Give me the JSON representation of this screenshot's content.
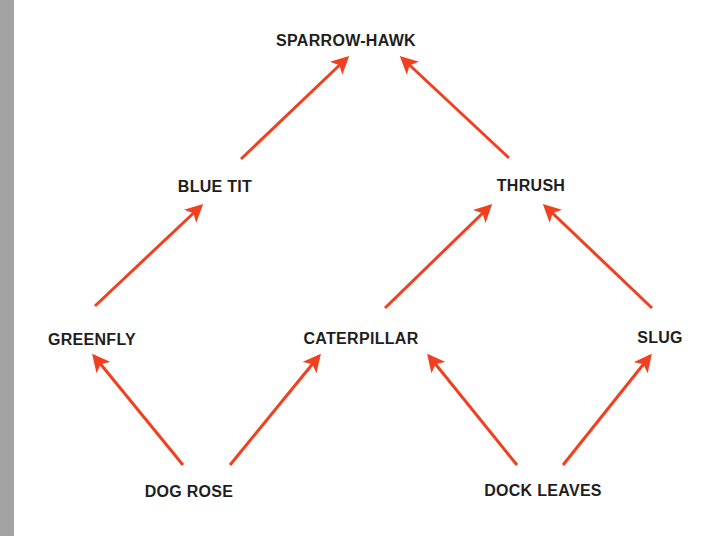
{
  "diagram": {
    "type": "food-web",
    "arrow_color": "#f04020",
    "text_color": "#1e1e1e",
    "strip_color": "#a3a3a3",
    "nodes": [
      {
        "id": "sparrowhawk",
        "label": "SPARROW-HAWK",
        "x": 346,
        "y": 41
      },
      {
        "id": "bluetit",
        "label": "BLUE TIT",
        "x": 215,
        "y": 187
      },
      {
        "id": "thrush",
        "label": "THRUSH",
        "x": 531,
        "y": 186
      },
      {
        "id": "greenfly",
        "label": "GREENFLY",
        "x": 92,
        "y": 340
      },
      {
        "id": "caterpillar",
        "label": "CATERPILLAR",
        "x": 361,
        "y": 339
      },
      {
        "id": "slug",
        "label": "SLUG",
        "x": 660,
        "y": 338
      },
      {
        "id": "dogrose",
        "label": "DOG ROSE",
        "x": 189,
        "y": 492
      },
      {
        "id": "dockleaves",
        "label": "DOCK LEAVES",
        "x": 543,
        "y": 491
      }
    ],
    "edges": [
      {
        "from": "bluetit",
        "to": "sparrowhawk",
        "x1": 241,
        "y1": 159,
        "x2": 347,
        "y2": 58
      },
      {
        "from": "thrush",
        "to": "sparrowhawk",
        "x1": 509,
        "y1": 158,
        "x2": 402,
        "y2": 58
      },
      {
        "from": "greenfly",
        "to": "bluetit",
        "x1": 95,
        "y1": 306,
        "x2": 201,
        "y2": 206
      },
      {
        "from": "caterpillar",
        "to": "thrush",
        "x1": 385,
        "y1": 308,
        "x2": 490,
        "y2": 206
      },
      {
        "from": "slug",
        "to": "thrush",
        "x1": 652,
        "y1": 308,
        "x2": 545,
        "y2": 206
      },
      {
        "from": "dogrose",
        "to": "greenfly",
        "x1": 183,
        "y1": 465,
        "x2": 94,
        "y2": 356
      },
      {
        "from": "dogrose",
        "to": "caterpillar",
        "x1": 230,
        "y1": 465,
        "x2": 319,
        "y2": 356
      },
      {
        "from": "dockleaves",
        "to": "caterpillar",
        "x1": 517,
        "y1": 465,
        "x2": 429,
        "y2": 356
      },
      {
        "from": "dockleaves",
        "to": "slug",
        "x1": 563,
        "y1": 465,
        "x2": 650,
        "y2": 356
      }
    ]
  }
}
